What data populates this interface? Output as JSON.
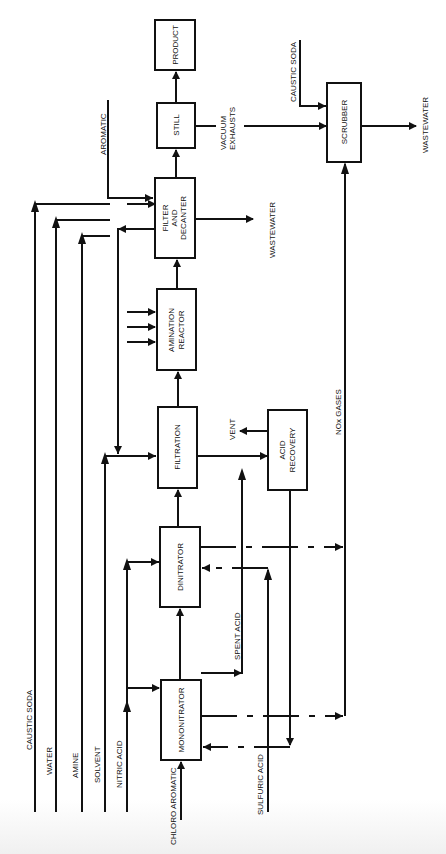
{
  "diagram": {
    "type": "process-flow",
    "orientation": "rotated-90-ccw",
    "units": [
      {
        "id": "product",
        "label": [
          "PRODUCT"
        ]
      },
      {
        "id": "still",
        "label": [
          "STILL"
        ]
      },
      {
        "id": "filter_decanter",
        "label": [
          "FILTER",
          "AND",
          "DECANTER"
        ]
      },
      {
        "id": "amination_reactor",
        "label": [
          "AMINATION",
          "REACTOR"
        ]
      },
      {
        "id": "filtration",
        "label": [
          "FILTRATION"
        ]
      },
      {
        "id": "dinitrator",
        "label": [
          "DINITRATOR"
        ]
      },
      {
        "id": "mononitrator",
        "label": [
          "MONONITRATOR"
        ]
      },
      {
        "id": "acid_recovery",
        "label": [
          "ACID",
          "RECOVERY"
        ]
      },
      {
        "id": "scrubber",
        "label": [
          "SCRUBBER"
        ]
      }
    ],
    "streams": {
      "caustic_soda_main": "CAUSTIC SODA",
      "water": "WATER",
      "amine": "AMINE",
      "solvent": "SOLVENT",
      "nitric_acid": "NITRIC ACID",
      "chloro_aromatic": "CHLORO AROMATIC",
      "sulfuric_acid": "SULFURIC ACID",
      "spent_acid": "SPENT ACID",
      "vent": "VENT",
      "nox_gases": "NOx GASES",
      "wastewater_decanter": "WASTEWATER",
      "aromatic": "AROMATIC",
      "vacuum_exhausts_1": "VACUUM",
      "vacuum_exhausts_2": "EXHAUSTS",
      "caustic_soda_scrubber": "CAUSTIC SODA",
      "wastewater_scrubber": "WASTEWATER"
    },
    "connections": [
      {
        "from": "chloro_aromatic",
        "to": "mononitrator"
      },
      {
        "from": "nitric_acid",
        "to": "mononitrator"
      },
      {
        "from": "nitric_acid",
        "to": "dinitrator"
      },
      {
        "from": "mononitrator",
        "to": "dinitrator"
      },
      {
        "from": "mononitrator",
        "to": "acid_recovery",
        "via": "spent_acid"
      },
      {
        "from": "mononitrator",
        "to": "scrubber",
        "via": "nox_gases"
      },
      {
        "from": "acid_recovery",
        "to": "mononitrator"
      },
      {
        "from": "sulfuric_acid",
        "to": "dinitrator"
      },
      {
        "from": "dinitrator",
        "to": "filtration"
      },
      {
        "from": "dinitrator",
        "to": "scrubber",
        "via": "nox_gases"
      },
      {
        "from": "solvent",
        "to": "filtration"
      },
      {
        "from": "filter_decanter",
        "to": "filtration",
        "via": "solvent recycle"
      },
      {
        "from": "filtration",
        "to": "acid_recovery"
      },
      {
        "from": "acid_recovery",
        "to": "vent"
      },
      {
        "from": "filtration",
        "to": "amination_reactor"
      },
      {
        "from": "caustic_soda_main",
        "to": "amination_reactor"
      },
      {
        "from": "water",
        "to": "amination_reactor"
      },
      {
        "from": "amine",
        "to": "amination_reactor"
      },
      {
        "from": "amination_reactor",
        "to": "filter_decanter"
      },
      {
        "from": "aromatic",
        "to": "filter_decanter"
      },
      {
        "from": "filter_decanter",
        "to": "wastewater_decanter"
      },
      {
        "from": "filter_decanter",
        "to": "still"
      },
      {
        "from": "still",
        "to": "product"
      },
      {
        "from": "still",
        "to": "scrubber",
        "via": "vacuum_exhausts"
      },
      {
        "from": "caustic_soda_scrubber",
        "to": "scrubber"
      },
      {
        "from": "scrubber",
        "to": "wastewater_scrubber"
      }
    ]
  }
}
